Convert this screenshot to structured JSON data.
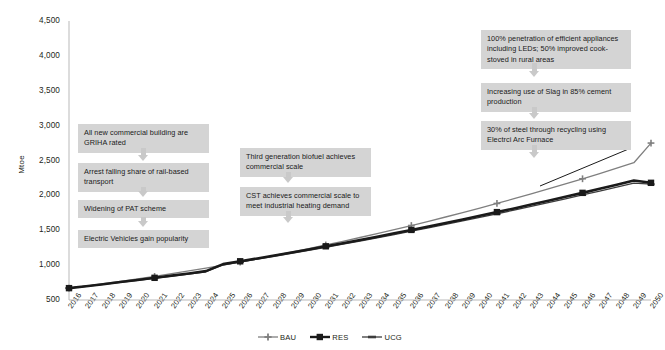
{
  "chart_data": {
    "type": "line",
    "title": "",
    "xlabel": "",
    "ylabel": "Mtoe",
    "ylim": [
      500,
      4500
    ],
    "ytick_labels": [
      "4,500",
      "4,000",
      "3,500",
      "3,000",
      "2,500",
      "2,000",
      "1,500",
      "1,000",
      "500"
    ],
    "ytick_values": [
      4500,
      4000,
      3500,
      3000,
      2500,
      2000,
      1500,
      1000,
      500
    ],
    "grid": false,
    "legend_position": "bottom-center",
    "categories": [
      "2016",
      "2017",
      "2018",
      "2019",
      "2020",
      "2021",
      "2022",
      "2023",
      "2024",
      "2025",
      "2026",
      "2027",
      "2028",
      "2029",
      "2030",
      "2031",
      "2032",
      "2033",
      "2034",
      "2035",
      "2036",
      "2037",
      "2038",
      "2039",
      "2040",
      "2041",
      "2042",
      "2043",
      "2044",
      "2045",
      "2046",
      "2047",
      "2048",
      "2049",
      "2050"
    ],
    "marker_years": [
      2016,
      2021,
      2026,
      2031,
      2036,
      2041,
      2046,
      2050
    ],
    "series": [
      {
        "name": "BAU",
        "color": "#7f7f7f",
        "marker": "plus",
        "values": [
          670,
          700,
          733,
          767,
          802,
          838,
          877,
          917,
          958,
          1001,
          1045,
          1091,
          1138,
          1187,
          1237,
          1289,
          1342,
          1396,
          1452,
          1509,
          1568,
          1628,
          1690,
          1753,
          1818,
          1884,
          1952,
          2021,
          2092,
          2164,
          2238,
          2313,
          2390,
          2468,
          2750
        ]
      },
      {
        "name": "RES",
        "color": "#1a1a1a",
        "marker": "square",
        "values": [
          670,
          698,
          727,
          757,
          787,
          818,
          849,
          881,
          914,
          1014,
          1055,
          1096,
          1138,
          1181,
          1225,
          1270,
          1315,
          1361,
          1408,
          1456,
          1505,
          1554,
          1604,
          1655,
          1707,
          1760,
          1813,
          1868,
          1923,
          1979,
          2036,
          2094,
          2153,
          2213,
          2180
        ]
      },
      {
        "name": "UCG",
        "color": "#3d3d3d",
        "marker": "dash",
        "values": [
          670,
          697,
          725,
          753,
          782,
          812,
          842,
          873,
          905,
          1005,
          1045,
          1086,
          1127,
          1169,
          1212,
          1256,
          1300,
          1345,
          1391,
          1438,
          1486,
          1534,
          1583,
          1633,
          1684,
          1736,
          1788,
          1841,
          1895,
          1950,
          2006,
          2062,
          2119,
          2177,
          2160
        ]
      }
    ],
    "annotations": [
      {
        "id": "ann-commercial-building",
        "text": "All new commercial building are GRIHA rated"
      },
      {
        "id": "ann-rail-transport",
        "text": "Arrest falling share of rail-based transport"
      },
      {
        "id": "ann-pat-scheme",
        "text": "Widening of PAT scheme"
      },
      {
        "id": "ann-electric-vehicles",
        "text": "Electric Vehicles gain popularity"
      },
      {
        "id": "ann-biofuel",
        "text": "Third generation biofuel achieves commercial scale"
      },
      {
        "id": "ann-cst",
        "text": "CST achieves commercial scale to meet industrial heating demand"
      },
      {
        "id": "ann-appliances",
        "text": "100% penetration of efficient appliances including LEDs;  50% improved cook-stoved in rural areas"
      },
      {
        "id": "ann-slag-cement",
        "text": "Increasing use of Slag in  85% cement production"
      },
      {
        "id": "ann-steel-recycling",
        "text": "30% of steel through recycling using Electrci Arc Furnace"
      }
    ]
  },
  "legend": {
    "items": [
      {
        "label": "BAU"
      },
      {
        "label": "RES"
      },
      {
        "label": "UCG"
      }
    ]
  }
}
